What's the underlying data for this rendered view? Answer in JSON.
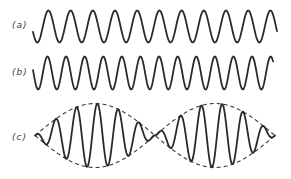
{
  "figure": {
    "panels": [
      {
        "id": "a",
        "label": "(a)",
        "label_pos": [
          12,
          20
        ],
        "type": "sine",
        "x_start": 33,
        "x_end": 277,
        "center_y": 26.5,
        "amplitude": 16,
        "period": 22.2,
        "phase_deg": 200
      },
      {
        "id": "b",
        "label": "(b)",
        "label_pos": [
          12,
          67
        ],
        "type": "sine",
        "x_start": 33,
        "x_end": 273,
        "center_y": 73,
        "amplitude": 16.5,
        "period": 18.6,
        "phase_deg": 170
      },
      {
        "id": "c",
        "label": "(c)",
        "label_pos": [
          12,
          132
        ],
        "type": "beat",
        "x_start": 35,
        "x_end": 275,
        "center_y": 135.5,
        "amplitude": 32,
        "carrier_period": 20.8,
        "beat_length": 120,
        "phase_deg": 90,
        "envelope_dashed": true
      }
    ],
    "colors": {
      "stroke": "#2a2a2a",
      "envelope": "#3a3a3a",
      "background": "#ffffff"
    }
  }
}
